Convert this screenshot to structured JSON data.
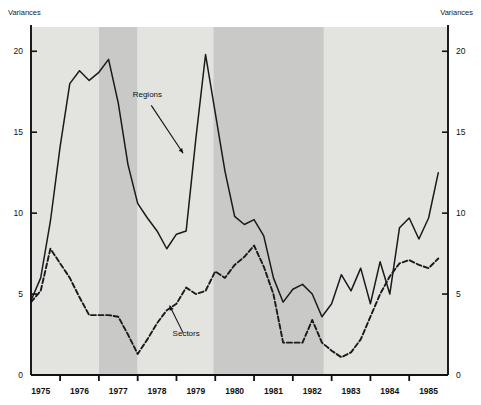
{
  "chart_data": {
    "type": "line",
    "title": "",
    "ylabel_left": "Variances",
    "ylabel_right": "Variances",
    "xlabel": "",
    "ylim": [
      0,
      21.5
    ],
    "yticks": [
      0,
      5,
      10,
      15,
      20
    ],
    "ytick_labels": [
      "0",
      "5",
      "10",
      "15",
      "20"
    ],
    "xlim": [
      1975.0,
      1985.75
    ],
    "xtick_labels": [
      "1975",
      "1976",
      "1977",
      "1978",
      "1979",
      "1980",
      "1981",
      "1982",
      "1983",
      "1984",
      "1985"
    ],
    "xticks": [
      1975.75,
      1976.75,
      1977.75,
      1978.75,
      1979.75,
      1980.75,
      1981.75,
      1982.75,
      1983.75,
      1984.75
    ],
    "grid": false,
    "legend_position": "inline-annotations",
    "annotations": [
      {
        "label": "Regions",
        "x": 1978.0,
        "y": 17.2,
        "point_x": 1978.95,
        "point_y": 13.6
      },
      {
        "label": "Sectors",
        "x": 1979.0,
        "y": 2.4,
        "point_x": 1978.55,
        "point_y": 4.4
      }
    ],
    "shaded_bands": [
      {
        "start": 1975.0,
        "end": 1976.75,
        "shade": "light"
      },
      {
        "start": 1976.75,
        "end": 1977.75,
        "shade": "dark"
      },
      {
        "start": 1977.75,
        "end": 1979.7,
        "shade": "light"
      },
      {
        "start": 1979.7,
        "end": 1982.55,
        "shade": "dark"
      },
      {
        "start": 1982.55,
        "end": 1985.75,
        "shade": "light"
      }
    ],
    "band_colors": {
      "light": "#e3e3e0",
      "dark": "#c9c9c7"
    },
    "line_color": "#1a1a1a",
    "x": [
      1975.0,
      1975.25,
      1975.5,
      1975.75,
      1976.0,
      1976.25,
      1976.5,
      1976.75,
      1977.0,
      1977.25,
      1977.5,
      1977.75,
      1978.0,
      1978.25,
      1978.5,
      1978.75,
      1979.0,
      1979.25,
      1979.5,
      1979.75,
      1980.0,
      1980.25,
      1980.5,
      1980.75,
      1981.0,
      1981.25,
      1981.5,
      1981.75,
      1982.0,
      1982.25,
      1982.5,
      1982.75,
      1983.0,
      1983.25,
      1983.5,
      1983.75,
      1984.0,
      1984.25,
      1984.5,
      1984.75,
      1985.0,
      1985.25,
      1985.5
    ],
    "series": [
      {
        "name": "Regions",
        "style": "solid",
        "values": [
          4.6,
          6.0,
          9.5,
          14.1,
          18.0,
          18.8,
          18.2,
          18.7,
          19.5,
          16.8,
          13.0,
          10.6,
          9.7,
          8.9,
          7.8,
          8.7,
          8.9,
          14.6,
          19.8,
          16.2,
          12.6,
          9.8,
          9.3,
          9.6,
          8.6,
          6.0,
          4.5,
          5.3,
          5.6,
          5.0,
          3.6,
          4.4,
          6.2,
          5.2,
          6.6,
          4.4,
          7.0,
          5.0,
          9.1,
          9.7,
          8.4,
          9.7,
          12.5
        ]
      },
      {
        "name": "Sectors",
        "style": "dashed",
        "values": [
          4.5,
          5.2,
          7.8,
          6.9,
          6.0,
          4.8,
          3.7,
          3.7,
          3.7,
          3.6,
          2.5,
          1.3,
          2.2,
          3.2,
          4.0,
          4.4,
          5.4,
          5.0,
          5.2,
          6.4,
          6.0,
          6.8,
          7.3,
          8.0,
          6.7,
          5.0,
          2.0,
          2.0,
          2.0,
          3.4,
          2.0,
          1.5,
          1.1,
          1.4,
          2.2,
          3.6,
          5.0,
          6.1,
          6.9,
          7.1,
          6.8,
          6.6,
          7.2
        ]
      }
    ]
  }
}
